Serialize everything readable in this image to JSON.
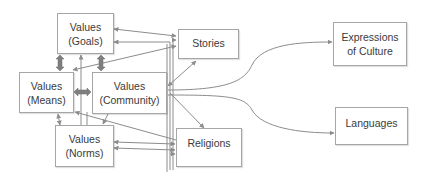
{
  "diagram": {
    "colors": {
      "line": "#8c8c8c",
      "box_border": "#a6a6a6",
      "text": "#3a3a3a",
      "thick_arrow": "#7f7f7f"
    },
    "nodes": {
      "goals": {
        "line1": "Values",
        "line2": "(Goals)"
      },
      "means": {
        "line1": "Values",
        "line2": "(Means)"
      },
      "community": {
        "line1": "Values",
        "line2": "(Community)"
      },
      "norms": {
        "line1": "Values",
        "line2": "(Norms)"
      },
      "stories": {
        "label": "Stories"
      },
      "religions": {
        "label": "Religions"
      },
      "expressions": {
        "line1": "Expressions",
        "line2": "of Culture"
      },
      "languages": {
        "label": "Languages"
      }
    },
    "edges": [
      {
        "from": "goals",
        "to": "means",
        "style": "thick-bidirectional"
      },
      {
        "from": "goals",
        "to": "community",
        "style": "thick-bidirectional"
      },
      {
        "from": "means",
        "to": "community",
        "style": "thick-bidirectional"
      },
      {
        "from": "goals",
        "to": "stories",
        "style": "bidirectional"
      },
      {
        "from": "means",
        "to": "stories",
        "style": "arrow"
      },
      {
        "from": "means",
        "to": "norms",
        "style": "bidirectional"
      },
      {
        "from": "community",
        "to": "norms",
        "style": "arrow"
      },
      {
        "from": "community",
        "to": "stories",
        "style": "bidirectional"
      },
      {
        "from": "community",
        "to": "religions",
        "style": "arrow"
      },
      {
        "from": "community",
        "to": "expressions",
        "style": "curved-arrow"
      },
      {
        "from": "community",
        "to": "languages",
        "style": "curved-arrow"
      },
      {
        "from": "norms",
        "to": "religions",
        "style": "bidirectional"
      },
      {
        "from": "means",
        "to": "religions",
        "style": "arrow"
      },
      {
        "from": "goals",
        "to": "religions",
        "style": "bidirectional"
      }
    ]
  }
}
